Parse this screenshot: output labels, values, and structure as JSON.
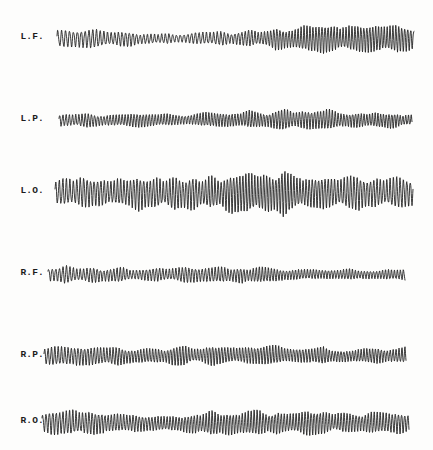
{
  "document": {
    "kind": "eeg-chart-recording",
    "background_color": "#fdfdfc",
    "ink_color": "#232323",
    "width": 433,
    "height": 450
  },
  "chart_data": {
    "type": "line",
    "title": "",
    "xlabel": "",
    "ylabel": "",
    "grid": false,
    "legend": "none",
    "axis_visible": false,
    "channels": [
      {
        "label": "L.F.",
        "name": "left-frontal",
        "baseline_y": 38,
        "trace_start_x": 57,
        "trace_end_x": 414,
        "mean_amplitude": 8,
        "amplitude_profile": [
          7,
          8,
          6,
          5,
          4,
          5,
          7,
          9,
          10,
          11,
          12,
          11
        ],
        "mean_frequency": 10.5,
        "frequency_profile": [
          9,
          9.5,
          10,
          10,
          9.5,
          10,
          11,
          12,
          12,
          12,
          12.5,
          12
        ],
        "seed": 11
      },
      {
        "label": "L.P.",
        "name": "left-parietal",
        "baseline_y": 120,
        "trace_start_x": 59,
        "trace_end_x": 412,
        "mean_amplitude": 6,
        "amplitude_profile": [
          6,
          6,
          5,
          5,
          5,
          6,
          7,
          8,
          8,
          7,
          6,
          5
        ],
        "mean_frequency": 12,
        "frequency_profile": [
          11,
          11.5,
          12,
          12,
          12,
          12.5,
          12.5,
          12,
          12,
          12.5,
          13,
          13
        ],
        "seed": 23
      },
      {
        "label": "L.O.",
        "name": "left-occipital",
        "baseline_y": 192,
        "trace_start_x": 55,
        "trace_end_x": 413,
        "mean_amplitude": 13,
        "amplitude_profile": [
          10,
          12,
          13,
          13,
          12,
          14,
          16,
          17,
          15,
          13,
          12,
          11
        ],
        "mean_frequency": 11,
        "frequency_profile": [
          10,
          10.5,
          11,
          11,
          11,
          11.5,
          12,
          12,
          11.5,
          11,
          11,
          10.5
        ],
        "seed": 37
      },
      {
        "label": "R.F.",
        "name": "right-frontal",
        "baseline_y": 274,
        "trace_start_x": 48,
        "trace_end_x": 405,
        "mean_amplitude": 6,
        "amplitude_profile": [
          7,
          7,
          6,
          5,
          6,
          7,
          7,
          6,
          5,
          5,
          4,
          4
        ],
        "mean_frequency": 11,
        "frequency_profile": [
          10,
          10.5,
          11,
          11,
          11,
          11,
          11.5,
          12,
          12,
          12,
          12,
          12
        ],
        "seed": 53
      },
      {
        "label": "R.P.",
        "name": "right-parietal",
        "baseline_y": 356,
        "trace_start_x": 44,
        "trace_end_x": 406,
        "mean_amplitude": 7,
        "amplitude_profile": [
          8,
          8,
          7,
          6,
          7,
          8,
          8,
          7,
          7,
          6,
          6,
          6
        ],
        "mean_frequency": 11.5,
        "frequency_profile": [
          10.5,
          11,
          11.5,
          12,
          12,
          12,
          12,
          12,
          12,
          12.5,
          12.5,
          12
        ],
        "seed": 71
      },
      {
        "label": "R.O.",
        "name": "right-occipital",
        "baseline_y": 422,
        "trace_start_x": 42,
        "trace_end_x": 409,
        "mean_amplitude": 9,
        "amplitude_profile": [
          9,
          10,
          9,
          8,
          9,
          10,
          10,
          9,
          9,
          9,
          8,
          8
        ],
        "mean_frequency": 11.5,
        "frequency_profile": [
          10.5,
          11,
          11.5,
          11.5,
          12,
          12,
          12,
          12,
          12,
          12,
          12,
          11.5
        ],
        "seed": 97
      }
    ]
  }
}
